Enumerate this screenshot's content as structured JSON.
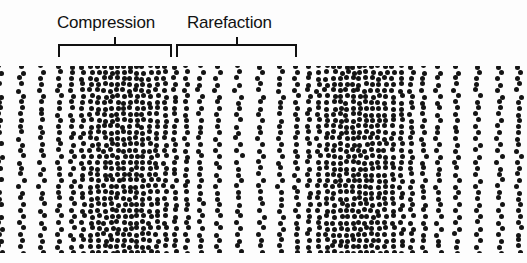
{
  "figure": {
    "background_color": "#fdfdfd",
    "particle_color": "#141414",
    "line_color": "#111111",
    "width": 527,
    "height": 263
  },
  "labels": {
    "compression": "Compression",
    "rarefaction": "Rarefaction"
  },
  "brackets": [
    {
      "name": "compression-bracket",
      "left": 58,
      "top": 44,
      "width": 114,
      "stem_height": 9
    },
    {
      "name": "rarefaction-bracket",
      "left": 176,
      "top": 44,
      "width": 121,
      "stem_height": 9
    }
  ],
  "chart_data": {
    "type": "scatter",
    "xlabel": "",
    "ylabel": "",
    "field": {
      "x_start": 0,
      "x_end": 527,
      "y_start": 66,
      "y_end": 253,
      "dot_diameter": 5
    },
    "density_profile": {
      "model": "cosine",
      "wavelength": 234,
      "compression_centers": [
        118,
        352
      ],
      "rarefaction_centers": [
        235,
        -117,
        469
      ],
      "min_spacing_px": 6.2,
      "max_spacing_px": 22.0,
      "jitter_px": 1.9
    },
    "annotations": [
      {
        "text": "Compression",
        "x": 115,
        "y": 22,
        "points_to_x": 118
      },
      {
        "text": "Rarefaction",
        "x": 234,
        "y": 22,
        "points_to_x": 235
      }
    ]
  }
}
